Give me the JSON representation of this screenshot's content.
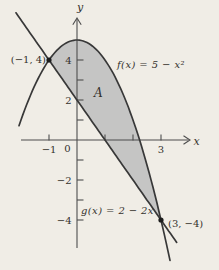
{
  "chart_data": {
    "type": "line",
    "title": "",
    "functions": [
      {
        "id": "f",
        "label": "f(x) = 5 − x²",
        "type": "quadratic",
        "coefficients": {
          "a": -1,
          "b": 0,
          "c": 5
        },
        "domain": [
          -2.07,
          3.32
        ]
      },
      {
        "id": "g",
        "label": "g(x) = 2 − 2x",
        "type": "linear",
        "coefficients": {
          "slope": -2,
          "intercept": 2
        },
        "domain": [
          -2.18,
          3.56
        ]
      }
    ],
    "region": {
      "label": "A",
      "between": [
        "f",
        "g"
      ],
      "x_from": -1,
      "x_to": 3,
      "fill": "#c5c5c4"
    },
    "intersection_points": [
      {
        "x": -1,
        "y": 4,
        "label": "(−1, 4)"
      },
      {
        "x": 3,
        "y": -4,
        "label": "(3, −4)"
      }
    ],
    "axes": {
      "x_label": "x",
      "y_label": "y",
      "origin_label": "0",
      "x_ticks": [
        {
          "value": -1,
          "label": "−1"
        },
        {
          "value": 1,
          "label": ""
        },
        {
          "value": 2,
          "label": ""
        },
        {
          "value": 3,
          "label": "3"
        }
      ],
      "y_ticks": [
        {
          "value": 4,
          "label": "4"
        },
        {
          "value": 3,
          "label": ""
        },
        {
          "value": 2,
          "label": "2"
        },
        {
          "value": 1,
          "label": ""
        },
        {
          "value": -1,
          "label": ""
        },
        {
          "value": -2,
          "label": "−2"
        },
        {
          "value": -3,
          "label": ""
        },
        {
          "value": -4,
          "label": "−4"
        }
      ],
      "x_range": [
        -2.2,
        4.0
      ],
      "y_range": [
        -5.6,
        6.1
      ],
      "grid": false
    },
    "colors": {
      "curve": "#383838",
      "fill": "#c5c5c4",
      "background": "#f0ede6",
      "text": "#35322d"
    }
  }
}
